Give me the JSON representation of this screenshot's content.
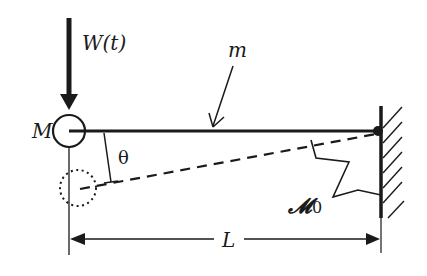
{
  "diagram": {
    "colors": {
      "ink": "#1a1a1a",
      "background": "#ffffff"
    },
    "labels": {
      "force": "W(t)",
      "tip_mass": "M",
      "beam_mass": "m",
      "angle": "θ",
      "spring_stiffness": "𝓜",
      "spring_subscript": "0",
      "length": "L"
    },
    "elements": {
      "force_arrow": {
        "direction": "down",
        "label": "W(t)"
      },
      "tip_mass_circle": {
        "style": "solid",
        "label": "M"
      },
      "displaced_mass_circle": {
        "style": "dotted"
      },
      "beam": {
        "style": "solid",
        "label": "m"
      },
      "displaced_beam": {
        "style": "dashed"
      },
      "rotation_angle": {
        "label": "θ"
      },
      "torsional_spring": {
        "label": "𝓜0"
      },
      "fixed_wall": {
        "style": "hatched",
        "side": "right"
      },
      "dimension": {
        "label": "L",
        "span": "tip to wall"
      }
    }
  }
}
